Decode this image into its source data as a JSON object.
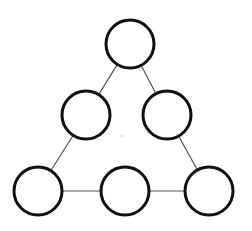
{
  "diagram": {
    "type": "triangle-node-graph",
    "width": 252,
    "height": 231,
    "colors": {
      "background": "#ffffff",
      "node_stroke": "#111111",
      "node_fill": "#ffffff",
      "edge_stroke": "#555555",
      "dot": "#999999"
    },
    "node_radius": 24,
    "node_stroke_width": 3,
    "edge_stroke_width": 1.2,
    "nodes": [
      {
        "id": "top",
        "cx": 130,
        "cy": 44,
        "label": ""
      },
      {
        "id": "middle-left",
        "cx": 86,
        "cy": 115,
        "label": ""
      },
      {
        "id": "middle-right",
        "cx": 167,
        "cy": 115,
        "label": ""
      },
      {
        "id": "bottom-left",
        "cx": 38,
        "cy": 191,
        "label": ""
      },
      {
        "id": "bottom-middle",
        "cx": 125,
        "cy": 191,
        "label": ""
      },
      {
        "id": "bottom-right",
        "cx": 209,
        "cy": 191,
        "label": ""
      }
    ],
    "edges": [
      {
        "from": "top",
        "to": "middle-left"
      },
      {
        "from": "top",
        "to": "middle-right"
      },
      {
        "from": "middle-left",
        "to": "bottom-left"
      },
      {
        "from": "middle-right",
        "to": "bottom-right"
      },
      {
        "from": "bottom-left",
        "to": "bottom-middle"
      },
      {
        "from": "bottom-middle",
        "to": "bottom-right"
      }
    ],
    "center_dot": {
      "cx": 122,
      "cy": 136,
      "r": 0.8
    }
  }
}
